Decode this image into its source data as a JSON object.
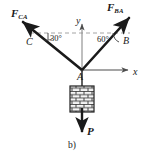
{
  "figure": {
    "caption": "b)",
    "type": "free-body-diagram"
  },
  "labels": {
    "force_left": {
      "symbol": "F",
      "subscript": "CA"
    },
    "force_right": {
      "symbol": "F",
      "subscript": "BA"
    },
    "weight": "P",
    "point_c": "C",
    "point_b": "B",
    "point_a": "A",
    "axis_x": "x",
    "axis_y": "y"
  },
  "angles": {
    "left": {
      "value": "30",
      "unit": "°",
      "text": "30°"
    },
    "right": {
      "value": "60",
      "unit": "°",
      "text": "60°"
    }
  },
  "colors": {
    "stroke": "#1a1a1a",
    "dashed": "#8c8c8c",
    "axis": "#4d4d4d",
    "block_fill": "#f2f2f2",
    "background": "#ffffff"
  },
  "geometry": {
    "joint": {
      "x": 82,
      "y": 70
    },
    "force_left_tip": {
      "x": 18,
      "y": 18
    },
    "force_right_tip": {
      "x": 133,
      "y": 14
    },
    "axis_x_end": {
      "x": 130,
      "y": 70
    },
    "axis_y_top": {
      "x": 82,
      "y": 22
    },
    "weight_tip": {
      "x": 82,
      "y": 136
    },
    "dashed_line_y": 33,
    "block": {
      "x": 70,
      "y": 86,
      "w": 24,
      "h": 26
    }
  }
}
